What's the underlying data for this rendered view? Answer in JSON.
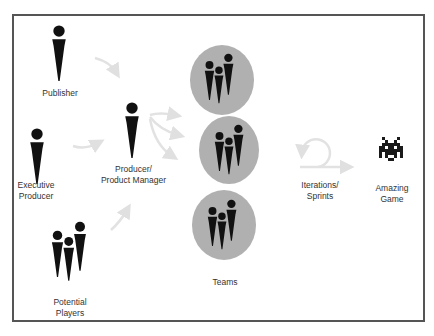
{
  "diagram": {
    "type": "process-flow",
    "colors": {
      "border": "#555555",
      "figure": "#111111",
      "team_circle": "#b0b0b0",
      "arrow": "#e4e4e4",
      "text": "#333333"
    },
    "nodes": {
      "publisher": {
        "label": "Publisher",
        "icon": "person-icon"
      },
      "executive_producer": {
        "label": "Executive\nProducer",
        "icon": "person-icon"
      },
      "potential_players": {
        "label": "Potential\nPlayers",
        "icon": "group-icon"
      },
      "producer": {
        "label": "Producer/\nProduct Manager",
        "icon": "person-icon"
      },
      "teams": {
        "label": "Teams",
        "icon": "team-circle-icon",
        "count": 3
      },
      "iterations": {
        "label": "Iterations/\nSprints",
        "icon": "loop-arrow-icon"
      },
      "game": {
        "label": "Amazing\nGame",
        "icon": "space-invader-icon"
      }
    },
    "edges": [
      {
        "from": "publisher",
        "to": "producer"
      },
      {
        "from": "executive_producer",
        "to": "producer"
      },
      {
        "from": "potential_players",
        "to": "producer"
      },
      {
        "from": "producer",
        "to": "teams"
      },
      {
        "from": "teams",
        "to": "iterations"
      },
      {
        "from": "iterations",
        "to": "game"
      }
    ]
  }
}
